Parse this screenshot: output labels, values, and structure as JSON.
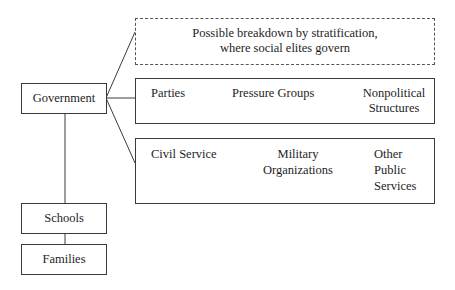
{
  "diagram": {
    "nodes": {
      "government": "Government",
      "schools": "Schools",
      "families": "Families",
      "stratification": {
        "line1": "Possible breakdown by stratification,",
        "line2": "where social elites govern"
      },
      "political_box": {
        "parties": "Parties",
        "pressure_groups": "Pressure Groups",
        "nonpolitical_line1": "Nonpolitical",
        "nonpolitical_line2": "Structures"
      },
      "services_box": {
        "civil_service": "Civil Service",
        "military_line1": "Military",
        "military_line2": "Organizations",
        "other_line1": "Other",
        "other_line2": "Public",
        "other_line3": "Services"
      }
    },
    "edges": [
      [
        "Government",
        "Possible breakdown by stratification"
      ],
      [
        "Government",
        "Parties / Pressure Groups / Nonpolitical Structures"
      ],
      [
        "Government",
        "Civil Service / Military Organizations / Other Public Services"
      ],
      [
        "Government",
        "Schools"
      ],
      [
        "Schools",
        "Families"
      ]
    ],
    "colors": {
      "line": "#3a3a3a",
      "background": "#ffffff"
    }
  }
}
